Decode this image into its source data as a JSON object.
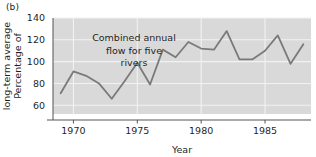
{
  "figure": {
    "panel_label": "(b)",
    "background_color": "#ffffff",
    "plot_background_color": "#d9d9d9",
    "line_color": "#7a7a7a",
    "gridline_color": "#f2f2f2",
    "axis_color": "#555555",
    "text_color": "#1f1f1f"
  },
  "chart_data": {
    "type": "line",
    "title": "",
    "subtitle": "",
    "annotation": "Combined annual flow for five rivers",
    "annotation_lines": [
      "Combined annual",
      "flow for five",
      "rivers"
    ],
    "xlabel": "Year",
    "ylabel": "Percentage of long-term average",
    "ylabel_lines": [
      "Percentage of",
      "long-term average"
    ],
    "xlim": [
      1968.4,
      1988.6
    ],
    "ylim": [
      52,
      140
    ],
    "xticks": [
      1970,
      1975,
      1980,
      1985
    ],
    "xtick_labels": [
      "1970",
      "1975",
      "1980",
      "1985"
    ],
    "yticks": [
      60,
      80,
      100,
      120,
      140
    ],
    "ytick_labels": [
      "60",
      "80",
      "100",
      "120",
      "140"
    ],
    "grid": true,
    "grid_axis": "both",
    "legend": "none",
    "series": [
      {
        "name": "Combined annual flow for five rivers",
        "x": [
          1969,
          1970,
          1971,
          1972,
          1973,
          1974,
          1975,
          1976,
          1977,
          1978,
          1979,
          1980,
          1981,
          1982,
          1983,
          1984,
          1985,
          1986,
          1987,
          1988
        ],
        "values": [
          71,
          91,
          87,
          80,
          66,
          82,
          99,
          79,
          111,
          104,
          118,
          112,
          111,
          128,
          102,
          102,
          110,
          124,
          98,
          116
        ]
      }
    ]
  }
}
